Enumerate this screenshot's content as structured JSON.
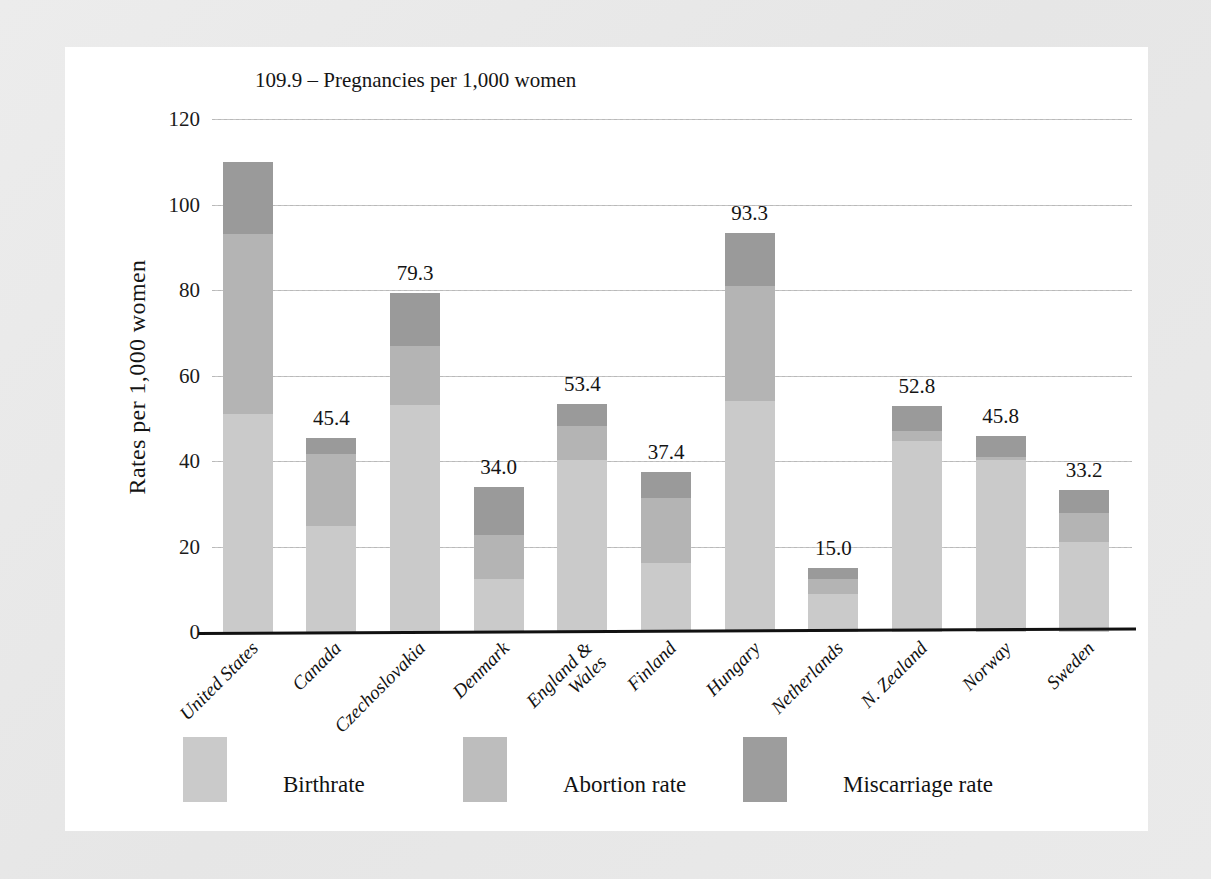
{
  "chart_data": {
    "type": "bar",
    "stacked": true,
    "title": "",
    "annotation": "109.9 – Pregnancies per 1,000 women",
    "xlabel": "",
    "ylabel": "Rates  per 1,000 women",
    "ylim": [
      0,
      120
    ],
    "yticks": [
      0,
      20,
      40,
      60,
      80,
      100,
      120
    ],
    "ytick_labels": [
      "0",
      "20",
      "40",
      "60",
      "80",
      "100",
      "120"
    ],
    "grid": true,
    "legend_position": "bottom",
    "categories": [
      "United States",
      "Canada",
      "Czechoslovakia",
      "Denmark",
      "England &\nWales",
      "Finland",
      "Hungary",
      "Netherlands",
      "N. Zealand",
      "Norway",
      "Sweden"
    ],
    "series": [
      {
        "name": "Birthrate",
        "color": "#cacaca",
        "values": [
          50.9,
          24.8,
          53.0,
          12.4,
          40.2,
          16.1,
          54.0,
          9.0,
          44.6,
          40.3,
          21.1
        ]
      },
      {
        "name": "Abortion rate",
        "color": "#b4b4b4",
        "values": [
          42.2,
          16.8,
          14.0,
          10.2,
          8.1,
          15.2,
          27.0,
          3.4,
          2.5,
          0.6,
          6.7
        ]
      },
      {
        "name": "Miscarriage rate",
        "color": "#9a9a9a",
        "values": [
          16.8,
          3.8,
          12.3,
          11.4,
          5.1,
          6.1,
          12.3,
          2.6,
          5.7,
          4.9,
          5.4
        ]
      }
    ],
    "totals": [
      109.9,
      45.4,
      79.3,
      34.0,
      53.4,
      37.4,
      93.3,
      15.0,
      52.8,
      45.8,
      33.2
    ],
    "total_labels": [
      "109.9",
      "45.4",
      "79.3",
      "34.0",
      "53.4",
      "37.4",
      "93.3",
      "15.0",
      "52.8",
      "45.8",
      "33.2"
    ],
    "first_total_label_suppressed": true
  },
  "legend": {
    "items": [
      {
        "label": "Birthrate",
        "swatch": "legend-swatch-birthrate"
      },
      {
        "label": "Abortion rate",
        "swatch": "legend-swatch-abortion"
      },
      {
        "label": "Miscarriage rate",
        "swatch": "legend-swatch-miscarriage"
      }
    ]
  }
}
